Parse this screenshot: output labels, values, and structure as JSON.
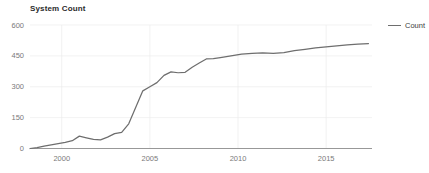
{
  "chart_data": {
    "type": "line",
    "title": "System Count",
    "xlabel": "",
    "ylabel": "",
    "xlim": [
      1998.2,
      2017.6
    ],
    "ylim": [
      0,
      600
    ],
    "grid": true,
    "legend_position": "right",
    "y_ticks": [
      0,
      150,
      300,
      450,
      600
    ],
    "y_tick_labels": [
      "0",
      "150",
      "300",
      "450",
      "600"
    ],
    "x_ticks": [
      2000,
      2005,
      2010,
      2015
    ],
    "x_tick_labels": [
      "2000",
      "2005",
      "2010",
      "2015"
    ],
    "line_color": "#6e6e6e",
    "series": [
      {
        "name": "Count",
        "x": [
          1998.2,
          1998.6,
          1999.0,
          1999.4,
          1999.8,
          2000.2,
          2000.6,
          2001.0,
          2001.4,
          2001.8,
          2002.2,
          2002.6,
          2003.0,
          2003.4,
          2003.8,
          2004.2,
          2004.6,
          2005.0,
          2005.4,
          2005.8,
          2006.2,
          2006.6,
          2007.0,
          2007.4,
          2007.8,
          2008.2,
          2008.6,
          2009.0,
          2009.6,
          2010.2,
          2010.8,
          2011.4,
          2012.0,
          2012.6,
          2013.2,
          2013.8,
          2014.4,
          2015.0,
          2015.6,
          2016.2,
          2016.8,
          2017.4
        ],
        "values": [
          0,
          4,
          12,
          18,
          24,
          30,
          38,
          60,
          52,
          44,
          42,
          55,
          72,
          78,
          120,
          200,
          280,
          300,
          320,
          355,
          372,
          368,
          370,
          395,
          415,
          435,
          437,
          442,
          450,
          458,
          462,
          464,
          462,
          466,
          475,
          482,
          489,
          494,
          499,
          503,
          507,
          510
        ]
      }
    ]
  },
  "legend": {
    "entries": [
      {
        "label": "Count",
        "color": "#6e6e6e",
        "marker": "line-swatch"
      }
    ]
  }
}
